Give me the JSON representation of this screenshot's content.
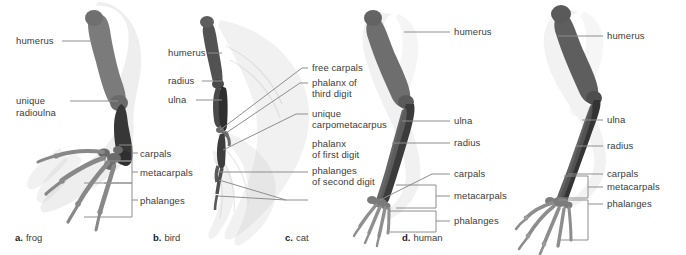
{
  "figure": {
    "background_color": "#ffffff",
    "line_color": "#8e8e8e",
    "text_color": "#3b3b3b",
    "bone_dark_color": "#3a3a3a",
    "bone_mid_color": "#767676",
    "bone_light_color": "#9d9d9d",
    "soft_tissue_color": "#dcdcdc"
  },
  "panels": [
    {
      "id": "frog",
      "caption_letter": "a.",
      "caption_text": "frog",
      "labels": [
        {
          "key": "humerus",
          "text": "humerus"
        },
        {
          "key": "radioulna_1",
          "text": "unique"
        },
        {
          "key": "radioulna_2",
          "text": "radioulna"
        },
        {
          "key": "carpals",
          "text": "carpals"
        },
        {
          "key": "metacarpals",
          "text": "metacarpals"
        },
        {
          "key": "phalanges",
          "text": "phalanges"
        }
      ]
    },
    {
      "id": "bird",
      "caption_letter": "b.",
      "caption_text": "bird",
      "labels": [
        {
          "key": "humerus",
          "text": "humerus"
        },
        {
          "key": "radius",
          "text": "radius"
        },
        {
          "key": "ulna",
          "text": "ulna"
        },
        {
          "key": "free_carpals",
          "text": "free carpals"
        },
        {
          "key": "phalanx3_1",
          "text": "phalanx of"
        },
        {
          "key": "phalanx3_2",
          "text": "third digit"
        },
        {
          "key": "carpometacarpus_1",
          "text": "unique"
        },
        {
          "key": "carpometacarpus_2",
          "text": "carpometacarpus"
        },
        {
          "key": "phalanx1_1",
          "text": "phalanx"
        },
        {
          "key": "phalanx1_2",
          "text": "of first digit"
        },
        {
          "key": "phalanges2_1",
          "text": "phalanges"
        },
        {
          "key": "phalanges2_2",
          "text": "of second digit"
        }
      ]
    },
    {
      "id": "cat",
      "caption_letter": "c.",
      "caption_text": "cat",
      "labels": [
        {
          "key": "humerus",
          "text": "humerus"
        },
        {
          "key": "ulna",
          "text": "ulna"
        },
        {
          "key": "radius",
          "text": "radius"
        },
        {
          "key": "carpals",
          "text": "carpals"
        },
        {
          "key": "metacarpals",
          "text": "metacarpals"
        },
        {
          "key": "phalanges",
          "text": "phalanges"
        }
      ]
    },
    {
      "id": "human",
      "caption_letter": "d.",
      "caption_text": "human",
      "labels": [
        {
          "key": "humerus",
          "text": "humerus"
        },
        {
          "key": "ulna",
          "text": "ulna"
        },
        {
          "key": "radius",
          "text": "radius"
        },
        {
          "key": "carpals",
          "text": "carpals"
        },
        {
          "key": "metacarpals",
          "text": "metacarpals"
        },
        {
          "key": "phalanges",
          "text": "phalanges"
        }
      ]
    }
  ]
}
